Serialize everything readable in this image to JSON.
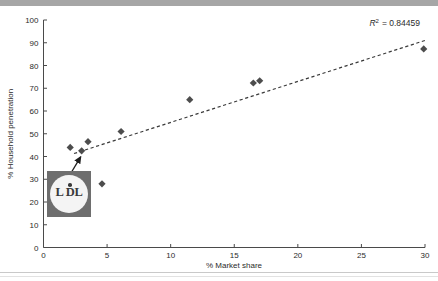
{
  "chart_data": {
    "type": "scatter",
    "title": "",
    "xlabel": "% Market share",
    "ylabel": "% Household penetration",
    "xlim": [
      0,
      30
    ],
    "ylim": [
      0,
      100
    ],
    "xticks": [
      0,
      5,
      10,
      15,
      20,
      25,
      30
    ],
    "yticks": [
      0,
      10,
      20,
      30,
      40,
      50,
      60,
      70,
      80,
      90,
      100
    ],
    "grid": false,
    "legend": null,
    "annotations": [
      {
        "name": "r2",
        "text": "R² = 0.84459",
        "r_symbol": "R",
        "superscript": "2",
        "equals_value": "= 0.84459"
      },
      {
        "name": "lidl-logo-callout",
        "text": "LiDL",
        "points_to_x": 3.0,
        "points_to_y": 42.5
      }
    ],
    "series": [
      {
        "name": "Retailers",
        "marker": "diamond",
        "color": "#4d4d4d",
        "points": [
          {
            "x": 2.1,
            "y": 44.0
          },
          {
            "x": 3.0,
            "y": 42.5
          },
          {
            "x": 3.5,
            "y": 46.5
          },
          {
            "x": 4.6,
            "y": 28.0
          },
          {
            "x": 6.1,
            "y": 51.0
          },
          {
            "x": 11.5,
            "y": 65.0
          },
          {
            "x": 16.5,
            "y": 72.3
          },
          {
            "x": 17.0,
            "y": 73.3
          },
          {
            "x": 29.9,
            "y": 87.3
          }
        ]
      }
    ],
    "trendline": {
      "type": "linear",
      "style": "dashed",
      "color": "#3a3a3a",
      "x_start": 2.4,
      "y_start": 41.3,
      "x_end": 30.0,
      "y_end": 91.0,
      "r_squared": 0.84459
    }
  },
  "logo": {
    "name": "lidl",
    "wordmark": "L DL",
    "left_letters": "L",
    "right_letters": "DL"
  },
  "ticks": {
    "x": [
      "0",
      "5",
      "10",
      "15",
      "20",
      "25",
      "30"
    ],
    "y": [
      "0",
      "10",
      "20",
      "30",
      "40",
      "50",
      "60",
      "70",
      "80",
      "90",
      "100"
    ]
  },
  "labels": {
    "x_axis_title": "% Market share",
    "y_axis_title": "% Household penetration",
    "r2": "R² = 0.84459",
    "r2_prefix": "R",
    "r2_sup": "2",
    "r2_suffix": "= 0.84459"
  },
  "colors": {
    "marker": "#4d4d4d",
    "trendline": "#3a3a3a",
    "axis": "#4a4a4a",
    "text": "#2b2b2b",
    "band": "#a6a6a6",
    "logo_square": "#6e6e6e",
    "logo_circle": "#f4f4f4"
  }
}
